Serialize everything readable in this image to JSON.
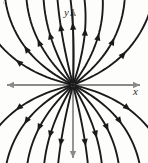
{
  "figure": {
    "kind": "phase-portrait",
    "caption": "",
    "background_color": "#fdfdfc",
    "width": 148,
    "height": 163
  },
  "axes": {
    "x_label": "x",
    "y_label": "y",
    "axis_color": "#8a8a8a",
    "origin": {
      "x": 73,
      "y": 85
    },
    "x_axis": {
      "start_x": 7,
      "end_x": 140,
      "y": 85,
      "arrow_left": true,
      "arrow_right": true
    },
    "y_axis": {
      "start_y": 9,
      "end_y": 158,
      "x": 73,
      "arrow_up": true,
      "arrow_down": true
    }
  },
  "chart_data": {
    "type": "scatter",
    "title": "",
    "xlabel": "x",
    "ylabel": "y",
    "xlim": [
      -1,
      1
    ],
    "ylim": [
      -1,
      1
    ],
    "grid": false,
    "legend": null,
    "equilibrium": {
      "x": 0,
      "y": 0,
      "classification": "unstable node",
      "stability": "unstable"
    },
    "flow_direction": "outward",
    "curve_color": "#1a1a1a",
    "curve_width": 1.9,
    "arrowhead_count_per_curve": 1,
    "trajectories": [
      {
        "id": "t1",
        "quadrant": "up-right",
        "angle_deg": 88,
        "bend": 0.1,
        "arrow_t": 0.52
      },
      {
        "id": "t2",
        "quadrant": "up-right",
        "angle_deg": 72,
        "bend": 0.28,
        "arrow_t": 0.5
      },
      {
        "id": "t3",
        "quadrant": "up-right",
        "angle_deg": 55,
        "bend": 0.4,
        "arrow_t": 0.5
      },
      {
        "id": "t4",
        "quadrant": "up-right",
        "angle_deg": 38,
        "bend": 0.46,
        "arrow_t": 0.52
      },
      {
        "id": "t5",
        "quadrant": "up-right",
        "angle_deg": 22,
        "bend": 0.44,
        "arrow_t": 0.55
      },
      {
        "id": "t6",
        "quadrant": "up-left",
        "angle_deg": 104,
        "bend": -0.1,
        "arrow_t": 0.52
      },
      {
        "id": "t7",
        "quadrant": "up-left",
        "angle_deg": 120,
        "bend": -0.28,
        "arrow_t": 0.5
      },
      {
        "id": "t8",
        "quadrant": "up-left",
        "angle_deg": 136,
        "bend": -0.4,
        "arrow_t": 0.5
      },
      {
        "id": "t9",
        "quadrant": "up-left",
        "angle_deg": 152,
        "bend": -0.46,
        "arrow_t": 0.52
      },
      {
        "id": "t10",
        "quadrant": "up-left",
        "angle_deg": 166,
        "bend": -0.42,
        "arrow_t": 0.55
      },
      {
        "id": "t11",
        "quadrant": "down-left",
        "angle_deg": 194,
        "bend": 0.42,
        "arrow_t": 0.55
      },
      {
        "id": "t12",
        "quadrant": "down-left",
        "angle_deg": 208,
        "bend": 0.46,
        "arrow_t": 0.52
      },
      {
        "id": "t13",
        "quadrant": "down-left",
        "angle_deg": 224,
        "bend": 0.4,
        "arrow_t": 0.5
      },
      {
        "id": "t14",
        "quadrant": "down-left",
        "angle_deg": 240,
        "bend": 0.28,
        "arrow_t": 0.5
      },
      {
        "id": "t15",
        "quadrant": "down-left",
        "angle_deg": 256,
        "bend": 0.1,
        "arrow_t": 0.52
      },
      {
        "id": "t16",
        "quadrant": "down-right",
        "angle_deg": 284,
        "bend": -0.1,
        "arrow_t": 0.52
      },
      {
        "id": "t17",
        "quadrant": "down-right",
        "angle_deg": 300,
        "bend": -0.28,
        "arrow_t": 0.5
      },
      {
        "id": "t18",
        "quadrant": "down-right",
        "angle_deg": 316,
        "bend": -0.4,
        "arrow_t": 0.5
      },
      {
        "id": "t19",
        "quadrant": "down-right",
        "angle_deg": 332,
        "bend": -0.46,
        "arrow_t": 0.52
      },
      {
        "id": "t20",
        "quadrant": "down-right",
        "angle_deg": 346,
        "bend": -0.42,
        "arrow_t": 0.55
      }
    ]
  }
}
